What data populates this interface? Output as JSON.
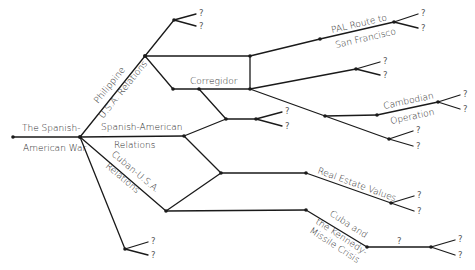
{
  "diagram": {
    "type": "branching-history-tree",
    "root": {
      "line1": "The Spanish-",
      "line2": "American War"
    },
    "branches": {
      "philippine": {
        "line1": "Philippine",
        "line2": "U.S.A. Relations"
      },
      "spanish_american": {
        "line1": "Spanish-American",
        "line2": "Relations"
      },
      "cuban": {
        "line1": "Cuban-U.S.A.",
        "line2": "Relations"
      },
      "corregidor": "Corregidor",
      "pal": {
        "line1": "PAL Route to",
        "line2": "San Francisco"
      },
      "cambodian": {
        "line1": "Cambodian",
        "line2": "Operation"
      },
      "real_estate": "Real Estate Values",
      "cuba_crisis": {
        "line1": "Cuba and",
        "line2": "the Kennedy-",
        "line3": "Missile Crisis"
      }
    },
    "unknown_marker": "?",
    "colors": {
      "line": "#1a1a1a",
      "text": "#2a2a2a",
      "question": "#555555",
      "background": "#ffffff"
    }
  }
}
